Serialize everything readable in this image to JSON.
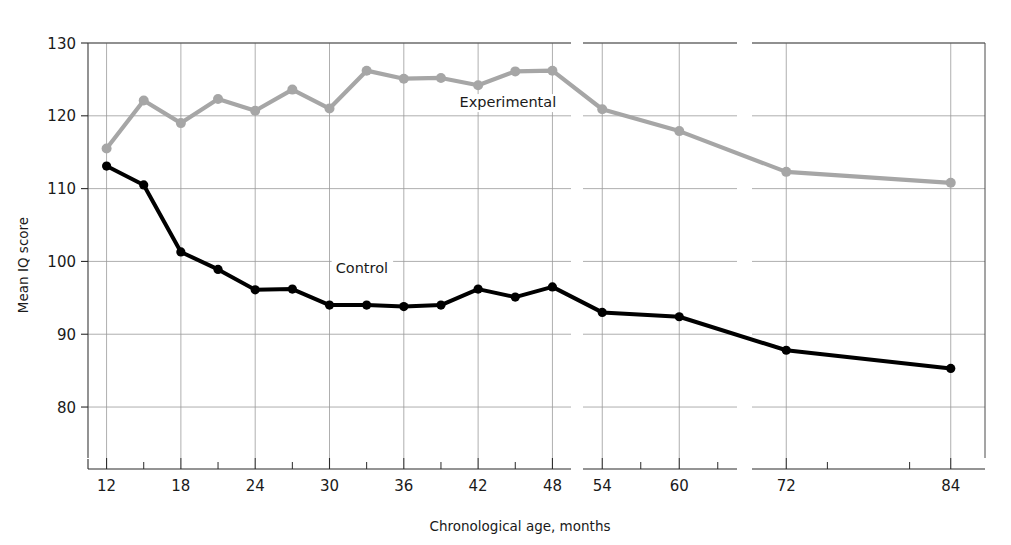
{
  "chart_data": {
    "type": "line",
    "title": "",
    "xlabel": "Chronological age, months",
    "ylabel": "Mean IQ score",
    "xlim": [
      9,
      87
    ],
    "ylim": [
      73,
      130
    ],
    "grid": true,
    "legend_position": "inline-annotation",
    "y_ticks": [
      80,
      90,
      100,
      110,
      120,
      130
    ],
    "x_ticks": [
      12,
      18,
      24,
      30,
      36,
      42,
      48,
      54,
      60,
      72,
      84
    ],
    "x_minor_ticks": [
      15,
      21,
      27,
      33,
      39,
      45,
      51,
      57,
      63,
      69,
      75,
      81
    ],
    "x_axis_breaks": [
      [
        49.5,
        52.5
      ],
      [
        64.5,
        69.5
      ]
    ],
    "x_axis_segments": [
      {
        "from": 10.5,
        "to": 49.5
      },
      {
        "from": 52.5,
        "to": 64.5
      },
      {
        "from": 69.5,
        "to": 86.5
      }
    ],
    "series": [
      {
        "name": "Experimental",
        "color": "#a6a6a6",
        "marker": "circle",
        "annotation": "Experimental",
        "annotation_x": 40.5,
        "annotation_y": 121.2,
        "points": [
          {
            "x": 12,
            "y": 115.5
          },
          {
            "x": 15,
            "y": 122.1
          },
          {
            "x": 18,
            "y": 119.0
          },
          {
            "x": 21,
            "y": 122.3
          },
          {
            "x": 24,
            "y": 120.7
          },
          {
            "x": 27,
            "y": 123.6
          },
          {
            "x": 30,
            "y": 121.0
          },
          {
            "x": 33,
            "y": 126.2
          },
          {
            "x": 36,
            "y": 125.1
          },
          {
            "x": 39,
            "y": 125.2
          },
          {
            "x": 42,
            "y": 124.2
          },
          {
            "x": 45,
            "y": 126.1
          },
          {
            "x": 48,
            "y": 126.2
          },
          {
            "x": 54,
            "y": 120.9
          },
          {
            "x": 60,
            "y": 117.9
          },
          {
            "x": 72,
            "y": 112.3
          },
          {
            "x": 84,
            "y": 110.8
          }
        ]
      },
      {
        "name": "Control",
        "color": "#000000",
        "marker": "circle",
        "annotation": "Control",
        "annotation_x": 30.5,
        "annotation_y": 98.4,
        "points": [
          {
            "x": 12,
            "y": 113.1
          },
          {
            "x": 15,
            "y": 110.5
          },
          {
            "x": 18,
            "y": 101.3
          },
          {
            "x": 21,
            "y": 98.9
          },
          {
            "x": 24,
            "y": 96.1
          },
          {
            "x": 27,
            "y": 96.2
          },
          {
            "x": 30,
            "y": 94.0
          },
          {
            "x": 33,
            "y": 94.0
          },
          {
            "x": 36,
            "y": 93.8
          },
          {
            "x": 39,
            "y": 94.0
          },
          {
            "x": 42,
            "y": 96.2
          },
          {
            "x": 45,
            "y": 95.1
          },
          {
            "x": 48,
            "y": 96.5
          },
          {
            "x": 54,
            "y": 93.0
          },
          {
            "x": 60,
            "y": 92.4
          },
          {
            "x": 72,
            "y": 87.8
          },
          {
            "x": 84,
            "y": 85.3
          }
        ]
      }
    ]
  }
}
